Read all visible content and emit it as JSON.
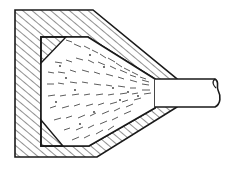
{
  "figure": {
    "type": "cross-section drawing",
    "colors": {
      "stroke": "#1a1a1a",
      "hatch": "#222222",
      "background": "#ffffff",
      "particles": "#333333"
    },
    "parts": [
      {
        "name": "housing-wall",
        "fill": "diagonal hatching"
      },
      {
        "name": "inner-cavity",
        "content": "speckled spray pattern"
      },
      {
        "name": "corner-fillets",
        "fill": "diagonal hatching"
      },
      {
        "name": "inlet-tube",
        "end": "wavy break line"
      }
    ]
  }
}
